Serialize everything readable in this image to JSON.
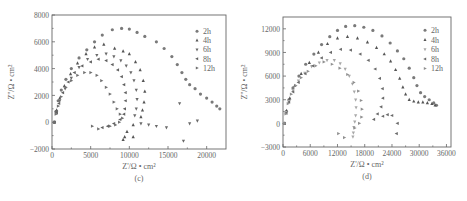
{
  "chart_data": [
    {
      "type": "scatter",
      "panel_label": "(c)",
      "title": "",
      "xlabel": "Z'/Ω • cm²",
      "ylabel": "Z''/Ω • cm²",
      "xlim": [
        0,
        22500
      ],
      "ylim": [
        -2000,
        8000
      ],
      "xticks": [
        0,
        5000,
        10000,
        15000,
        20000
      ],
      "xtick_labels": [
        "0",
        "5000",
        "10000",
        "15000",
        "20000"
      ],
      "yticks": [
        -2000,
        0,
        2000,
        4000,
        6000,
        8000
      ],
      "ytick_labels": [
        "-2000",
        "0",
        "2000",
        "4000",
        "6000",
        "8000"
      ],
      "grid": false,
      "legend_position": "upper right",
      "series": [
        {
          "name": "2h",
          "marker": "circle",
          "points": [
            [
              300,
              0
            ],
            [
              500,
              800
            ],
            [
              800,
              1600
            ],
            [
              1200,
              2400
            ],
            [
              1800,
              3200
            ],
            [
              2500,
              4000
            ],
            [
              3500,
              4800
            ],
            [
              4500,
              5400
            ],
            [
              5500,
              6000
            ],
            [
              6500,
              6500
            ],
            [
              7800,
              6900
            ],
            [
              9000,
              7000
            ],
            [
              10000,
              6950
            ],
            [
              11000,
              6700
            ],
            [
              12000,
              6400
            ],
            [
              13500,
              6000
            ],
            [
              14500,
              5500
            ],
            [
              15500,
              4900
            ],
            [
              16200,
              4300
            ],
            [
              16800,
              3700
            ],
            [
              17300,
              3200
            ],
            [
              17800,
              2800
            ],
            [
              18500,
              2500
            ],
            [
              19200,
              2100
            ],
            [
              20000,
              1800
            ],
            [
              20700,
              1500
            ],
            [
              21300,
              1200
            ],
            [
              21700,
              1000
            ]
          ]
        },
        {
          "name": "4h",
          "marker": "triangle-up",
          "points": [
            [
              300,
              0
            ],
            [
              600,
              900
            ],
            [
              1000,
              1800
            ],
            [
              1600,
              2700
            ],
            [
              2400,
              3600
            ],
            [
              3300,
              4400
            ],
            [
              4400,
              5100
            ],
            [
              5500,
              5600
            ],
            [
              6700,
              5800
            ],
            [
              8100,
              5500
            ],
            [
              9200,
              5300
            ],
            [
              10000,
              5100
            ],
            [
              10800,
              4500
            ],
            [
              11400,
              3900
            ],
            [
              11800,
              3100
            ],
            [
              12000,
              2300
            ],
            [
              11900,
              1500
            ],
            [
              11700,
              900
            ],
            [
              11500,
              400
            ],
            [
              10500,
              -200
            ],
            [
              9700,
              -700
            ],
            [
              9400,
              -1100
            ],
            [
              9200,
              -1300
            ],
            [
              10500,
              -1100
            ]
          ]
        },
        {
          "name": "6h",
          "marker": "triangle-down",
          "points": [
            [
              300,
              0
            ],
            [
              600,
              800
            ],
            [
              1000,
              1600
            ],
            [
              1700,
              2500
            ],
            [
              2500,
              3300
            ],
            [
              3500,
              4100
            ],
            [
              4600,
              4700
            ],
            [
              5800,
              5000
            ],
            [
              7000,
              5100
            ],
            [
              8000,
              4900
            ],
            [
              8900,
              4600
            ],
            [
              9600,
              4200
            ],
            [
              10200,
              3700
            ],
            [
              10600,
              3100
            ],
            [
              10900,
              2400
            ],
            [
              11000,
              1700
            ],
            [
              10900,
              1000
            ],
            [
              10700,
              500
            ],
            [
              11500,
              -100
            ],
            [
              12500,
              -200
            ],
            [
              13500,
              -300
            ],
            [
              14800,
              -400
            ],
            [
              16500,
              1400
            ],
            [
              17000,
              -1400
            ],
            [
              17800,
              -100
            ],
            [
              18800,
              100
            ]
          ]
        },
        {
          "name": "8h",
          "marker": "triangle-left",
          "points": [
            [
              300,
              0
            ],
            [
              600,
              700
            ],
            [
              900,
              1400
            ],
            [
              1400,
              2200
            ],
            [
              2100,
              3000
            ],
            [
              2900,
              3700
            ],
            [
              3900,
              4200
            ],
            [
              5000,
              4500
            ],
            [
              6000,
              4700
            ],
            [
              7000,
              4600
            ],
            [
              7800,
              4300
            ],
            [
              8500,
              3900
            ],
            [
              9000,
              3400
            ],
            [
              9300,
              2800
            ],
            [
              9500,
              2200
            ],
            [
              9500,
              1600
            ],
            [
              9400,
              1000
            ],
            [
              9300,
              600
            ],
            [
              8800,
              200
            ],
            [
              8000,
              -100
            ],
            [
              7200,
              -300
            ],
            [
              6500,
              -400
            ]
          ]
        },
        {
          "name": "12h",
          "marker": "triangle-right",
          "points": [
            [
              300,
              0
            ],
            [
              500,
              600
            ],
            [
              800,
              1200
            ],
            [
              1200,
              1900
            ],
            [
              1800,
              2600
            ],
            [
              2500,
              3100
            ],
            [
              3300,
              3500
            ],
            [
              4200,
              3700
            ],
            [
              5000,
              3700
            ],
            [
              5800,
              3500
            ],
            [
              6400,
              3100
            ],
            [
              7000,
              2600
            ],
            [
              7500,
              2100
            ],
            [
              8000,
              1500
            ],
            [
              8400,
              1000
            ],
            [
              8800,
              600
            ],
            [
              9100,
              300
            ],
            [
              8700,
              0
            ],
            [
              8200,
              -200
            ],
            [
              7500,
              -300
            ],
            [
              6000,
              -500
            ],
            [
              5200,
              -300
            ]
          ]
        }
      ]
    },
    {
      "type": "scatter",
      "panel_label": "(d)",
      "title": "",
      "xlabel": "Z'/Ω • cm²",
      "ylabel": "Z''/Ω • cm²",
      "xlim": [
        0,
        37000
      ],
      "ylim": [
        -3000,
        13500
      ],
      "xticks": [
        0,
        6000,
        12000,
        18000,
        24000,
        30000,
        36000
      ],
      "xtick_labels": [
        "0",
        "6000",
        "12000",
        "18000",
        "24000",
        "30000",
        "36000"
      ],
      "yticks": [
        -3000,
        0,
        3000,
        6000,
        9000,
        12000
      ],
      "ytick_labels": [
        "-3000",
        "0",
        "3000",
        "6000",
        "9000",
        "12000"
      ],
      "grid": false,
      "legend_position": "upper right",
      "series": [
        {
          "name": "2h",
          "marker": "circle",
          "points": [
            [
              300,
              0
            ],
            [
              700,
              1500
            ],
            [
              1300,
              3000
            ],
            [
              2200,
              4500
            ],
            [
              3500,
              6000
            ],
            [
              5000,
              7500
            ],
            [
              6800,
              8800
            ],
            [
              8500,
              10000
            ],
            [
              10300,
              11000
            ],
            [
              12000,
              11800
            ],
            [
              13800,
              12300
            ],
            [
              15800,
              12400
            ],
            [
              17800,
              12200
            ],
            [
              19800,
              11800
            ],
            [
              21800,
              11100
            ],
            [
              23600,
              10200
            ],
            [
              25200,
              9200
            ],
            [
              26600,
              8200
            ],
            [
              27800,
              7000
            ],
            [
              28800,
              5800
            ],
            [
              29500,
              4800
            ],
            [
              30300,
              3900
            ],
            [
              31200,
              3400
            ],
            [
              32200,
              3000
            ],
            [
              33200,
              2600
            ],
            [
              33800,
              2300
            ]
          ]
        },
        {
          "name": "4h",
          "marker": "triangle-up",
          "points": [
            [
              300,
              0
            ],
            [
              800,
              1600
            ],
            [
              1500,
              3200
            ],
            [
              2600,
              4800
            ],
            [
              4000,
              6300
            ],
            [
              5800,
              7700
            ],
            [
              7800,
              9000
            ],
            [
              9800,
              10100
            ],
            [
              12000,
              10800
            ],
            [
              14200,
              11000
            ],
            [
              16400,
              10800
            ],
            [
              18600,
              10300
            ],
            [
              20600,
              9600
            ],
            [
              22300,
              8800
            ],
            [
              23700,
              7900
            ],
            [
              24800,
              6800
            ],
            [
              25700,
              5700
            ],
            [
              26400,
              4600
            ],
            [
              27000,
              3700
            ],
            [
              27800,
              3000
            ],
            [
              28800,
              2800
            ],
            [
              29800,
              2700
            ],
            [
              30800,
              2700
            ],
            [
              31800,
              2600
            ],
            [
              32800,
              2500
            ],
            [
              33500,
              2300
            ]
          ]
        },
        {
          "name": "6h",
          "marker": "triangle-down",
          "points": [
            [
              300,
              0
            ],
            [
              700,
              1400
            ],
            [
              1300,
              2800
            ],
            [
              2200,
              4200
            ],
            [
              3400,
              5400
            ],
            [
              4800,
              6400
            ],
            [
              6300,
              7200
            ],
            [
              8000,
              7700
            ],
            [
              9700,
              8000
            ],
            [
              11300,
              8000
            ],
            [
              12600,
              7600
            ],
            [
              13700,
              6900
            ],
            [
              14600,
              6000
            ],
            [
              15300,
              5000
            ],
            [
              15700,
              4000
            ],
            [
              16000,
              3000
            ],
            [
              16100,
              2000
            ],
            [
              16000,
              1000
            ],
            [
              15800,
              200
            ],
            [
              15600,
              -500
            ],
            [
              15500,
              -1200
            ],
            [
              15400,
              -1700
            ]
          ]
        },
        {
          "name": "8h",
          "marker": "triangle-left",
          "points": [
            [
              300,
              0
            ],
            [
              700,
              1300
            ],
            [
              1300,
              2700
            ],
            [
              2200,
              4000
            ],
            [
              3400,
              5200
            ],
            [
              4900,
              6300
            ],
            [
              6600,
              7300
            ],
            [
              8500,
              8300
            ],
            [
              10500,
              9000
            ],
            [
              12700,
              9400
            ],
            [
              14900,
              9300
            ],
            [
              17000,
              8800
            ],
            [
              18800,
              8000
            ],
            [
              20300,
              6900
            ],
            [
              21300,
              5700
            ],
            [
              21900,
              4400
            ],
            [
              22000,
              3200
            ],
            [
              21600,
              2100
            ],
            [
              20800,
              1200
            ],
            [
              20000,
              500
            ],
            [
              22000,
              900
            ],
            [
              23000,
              1100
            ],
            [
              24000,
              1000
            ],
            [
              25200,
              0
            ],
            [
              25000,
              -1300
            ]
          ]
        },
        {
          "name": "12h",
          "marker": "triangle-right",
          "points": [
            [
              300,
              0
            ],
            [
              600,
              1200
            ],
            [
              1100,
              2500
            ],
            [
              1800,
              3700
            ],
            [
              2800,
              4800
            ],
            [
              4000,
              5800
            ],
            [
              5500,
              6600
            ],
            [
              7200,
              7300
            ],
            [
              9000,
              7800
            ],
            [
              10800,
              7500
            ],
            [
              12500,
              7000
            ],
            [
              14200,
              6200
            ],
            [
              15600,
              5200
            ],
            [
              16600,
              4100
            ],
            [
              17200,
              2900
            ],
            [
              17400,
              1800
            ],
            [
              17300,
              800
            ],
            [
              16800,
              0
            ],
            [
              15800,
              -600
            ],
            [
              13500,
              -1800
            ],
            [
              12200,
              -1300
            ]
          ]
        }
      ]
    }
  ],
  "panels": {
    "c": {
      "label": "(c)",
      "xlabel": "Z'/Ω • cm²",
      "ylabel": "Z''/Ω • cm²",
      "legend": [
        "2h",
        "4h",
        "6h",
        "8h",
        "12h"
      ]
    },
    "d": {
      "label": "(d)",
      "xlabel": "Z'/Ω • cm²",
      "ylabel": "Z''/Ω • cm²",
      "legend": [
        "2h",
        "4h",
        "6h",
        "8h",
        "12h"
      ]
    }
  },
  "colors": {
    "axis": "#666666",
    "c": [
      "#7a7a7a",
      "#555555",
      "#6a6a6a",
      "#606060",
      "#707070"
    ],
    "d": [
      "#7a7a7a",
      "#555555",
      "#a8a8a8",
      "#6a6a6a",
      "#909090"
    ]
  }
}
